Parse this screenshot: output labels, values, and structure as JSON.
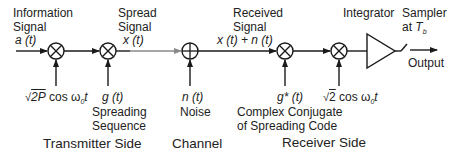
{
  "title_blocks": {
    "information_signal": {
      "line1": "Information",
      "line2": "Signal",
      "symbol": "a (t)"
    },
    "spread_signal": {
      "line1": "Spread",
      "line2": "Signal",
      "symbol": "x (t)"
    },
    "received_signal": {
      "line1": "Received",
      "line2": "Signal",
      "symbol": "x (t) + n (t)"
    },
    "integrator": {
      "label": "Integrator"
    },
    "sampler": {
      "line1": "Sampler",
      "line2_prefix": "at ",
      "line2_symbol": "T",
      "line2_sub": "b"
    },
    "output": {
      "label": "Output"
    }
  },
  "inputs": {
    "carrier_tx": {
      "radical": "2P",
      "rest": " cos ω",
      "sub": "0",
      "tail": "t"
    },
    "spreading": {
      "symbol": "g (t)",
      "line1": "Spreading",
      "line2": "Sequence"
    },
    "noise": {
      "symbol": "n (t)",
      "label": "Noise"
    },
    "conj_code": {
      "symbol": "g* (t)",
      "line1": "Complex Conjugate",
      "line2": "of Spreading Code"
    },
    "carrier_rx": {
      "radical": "2",
      "rest": " cos ω",
      "sub": "0",
      "tail": "t"
    }
  },
  "sections": {
    "transmitter": "Transmitter Side",
    "channel": "Channel",
    "receiver": "Receiver Side"
  },
  "blocks": [
    {
      "id": "mult1",
      "type": "multiplier",
      "cx": 56,
      "cy": 51
    },
    {
      "id": "mult2",
      "type": "multiplier",
      "cx": 108,
      "cy": 51
    },
    {
      "id": "adder",
      "type": "adder",
      "cx": 190,
      "cy": 51
    },
    {
      "id": "mult3",
      "type": "multiplier",
      "cx": 285,
      "cy": 51
    },
    {
      "id": "mult4",
      "type": "multiplier",
      "cx": 339,
      "cy": 51
    },
    {
      "id": "integrator",
      "type": "triangle"
    },
    {
      "id": "sampler",
      "type": "switch"
    }
  ],
  "colors": {
    "line": "#1a1a1a",
    "channel_line": "#8a8a8a"
  }
}
